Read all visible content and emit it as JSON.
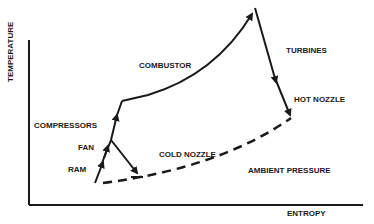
{
  "diagram": {
    "title": "",
    "axes": {
      "y_label": "TEMPERATURE",
      "x_label": "ENTROPY"
    },
    "stages": {
      "ram": "RAM",
      "fan": "FAN",
      "compressors": "COMPRESSORS",
      "combustor": "COMBUSTOR",
      "turbines": "TURBINES",
      "hot_nozzle": "HOT NOZZLE",
      "cold_nozzle": "COLD NOZZLE",
      "ambient": "AMBIENT PRESSURE"
    },
    "colors": {
      "line": "#1a1a1a",
      "background": "#ffffff"
    }
  }
}
